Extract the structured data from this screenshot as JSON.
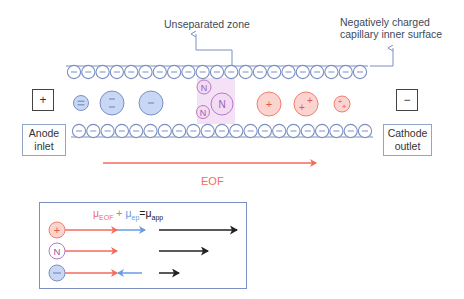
{
  "labels": {
    "unseparated_zone": "Unseparated zone",
    "negatively_charged_line1": "Negatively charged",
    "negatively_charged_line2": "capillary inner surface",
    "anode_symbol": "+",
    "cathode_symbol": "−",
    "anode_line1": "Anode",
    "anode_line2": "inlet",
    "cathode_line1": "Cathode",
    "cathode_line2": "outlet",
    "eof": "EOF"
  },
  "legend": {
    "equation": {
      "mu_eof": "μ",
      "eof_sub": "EOF",
      "plus": " + ",
      "mu_ep": "μ",
      "ep_sub": "ep",
      "equals": "=",
      "mu_app": "μ",
      "app_sub": "app"
    },
    "rows": [
      {
        "species": "+",
        "name": "cation"
      },
      {
        "species": "N",
        "name": "neutral"
      },
      {
        "species": "−",
        "name": "anion"
      }
    ]
  },
  "colors": {
    "eof": "#f26b5b",
    "ep": "#6a9be0",
    "app": "#222222",
    "wall": "#7b8fc4",
    "anion_fill": "#c8d8f4",
    "cation_fill": "#fbd3cf",
    "neutral": "#b27ac8",
    "zone": "#f0d9f0"
  },
  "capillary": {
    "wall_charge": "−"
  }
}
